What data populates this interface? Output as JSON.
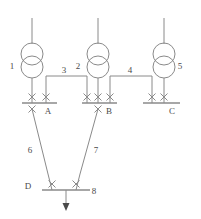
{
  "diagram": {
    "type": "single-line-electrical-diagram",
    "stroke_color": "#8a8a8a",
    "label_color": "#4a4a4a",
    "background_color": "#ffffff",
    "transformers": [
      {
        "label": "1",
        "cx": 32,
        "label_x": 12,
        "label_y": 69,
        "top_lead_y": 18
      },
      {
        "label": "2",
        "cx": 98,
        "label_x": 78,
        "label_y": 69,
        "top_lead_y": 18
      },
      {
        "label": "5",
        "cx": 164,
        "label_x": 180,
        "label_y": 69,
        "top_lead_y": 18
      }
    ],
    "busbars": [
      {
        "label": "A",
        "x1": 22,
        "x2": 57,
        "y": 103,
        "label_x": 48,
        "label_y": 112
      },
      {
        "label": "B",
        "x1": 82,
        "x2": 117,
        "y": 103,
        "label_x": 108,
        "label_y": 112
      },
      {
        "label": "C",
        "x1": 143,
        "x2": 180,
        "y": 103,
        "label_x": 172,
        "label_y": 112
      },
      {
        "label": "D",
        "x1": 42,
        "x2": 90,
        "y": 190,
        "label_x": 28,
        "label_y": 189
      }
    ],
    "tie_lines": [
      {
        "label": "3",
        "label_x": 64,
        "label_y": 80,
        "from_bus": "A",
        "to_bus": "B"
      },
      {
        "label": "4",
        "label_x": 130,
        "label_y": 80,
        "from_bus": "B",
        "to_bus": "C"
      }
    ],
    "feeders": [
      {
        "label": "6",
        "label_x": 30,
        "label_y": 150,
        "from_bus": "A",
        "to_bus": "D"
      },
      {
        "label": "7",
        "label_x": 96,
        "label_y": 150,
        "from_bus": "B",
        "to_bus": "D"
      }
    ],
    "load": {
      "label": "8",
      "label_x": 92,
      "label_y": 192,
      "direction": "down"
    },
    "breaker_symbol": "X",
    "breakers": [
      {
        "name": "breaker-a-transformer",
        "x": 32,
        "y": 97
      },
      {
        "name": "breaker-a-tie3",
        "x": 46,
        "y": 97
      },
      {
        "name": "breaker-a-feeder6",
        "x": 32,
        "y": 109
      },
      {
        "name": "breaker-b-tie3",
        "x": 87,
        "y": 97
      },
      {
        "name": "breaker-b-transformer",
        "x": 98,
        "y": 97
      },
      {
        "name": "breaker-b-tie4",
        "x": 110,
        "y": 97
      },
      {
        "name": "breaker-b-feeder7",
        "x": 98,
        "y": 109
      },
      {
        "name": "breaker-c-tie4",
        "x": 152,
        "y": 97
      },
      {
        "name": "breaker-c-transformer",
        "x": 164,
        "y": 97
      },
      {
        "name": "breaker-d-feeder6",
        "x": 52,
        "y": 184
      },
      {
        "name": "breaker-d-feeder7",
        "x": 76,
        "y": 184
      }
    ]
  }
}
